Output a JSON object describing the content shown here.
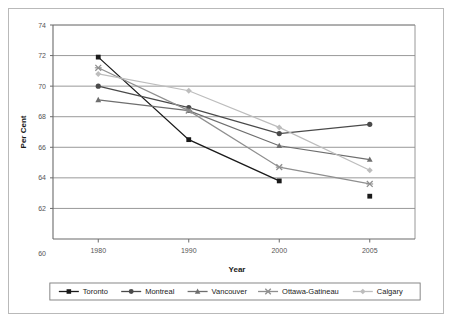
{
  "chart_data": {
    "type": "line",
    "title": "",
    "xlabel": "Year",
    "ylabel": "Per Cent",
    "categories": [
      "1980",
      "1990",
      "2000",
      "2005"
    ],
    "ylim": [
      60,
      74
    ],
    "yticks": [
      60,
      62,
      64,
      66,
      68,
      70,
      72,
      74
    ],
    "ytick_labels": [
      "60",
      "62",
      "64",
      "66",
      "68",
      "70",
      "72",
      "74"
    ],
    "grid": true,
    "legend_position": "bottom",
    "series": [
      {
        "name": "Toronto",
        "values": [
          71.9,
          66.5,
          63.8,
          62.8
        ],
        "color": "#1a1a1a",
        "marker": "square",
        "last_point_detached": true
      },
      {
        "name": "Montreal",
        "values": [
          70.0,
          68.6,
          66.9,
          67.5
        ],
        "color": "#4a4a4a",
        "marker": "circle",
        "last_point_detached": false
      },
      {
        "name": "Vancouver",
        "values": [
          69.1,
          68.4,
          66.1,
          65.2
        ],
        "color": "#6e6e6e",
        "marker": "triangle",
        "last_point_detached": false
      },
      {
        "name": "Ottawa-Gatineau",
        "values": [
          71.2,
          68.4,
          64.7,
          63.6
        ],
        "color": "#8f8f8f",
        "marker": "x",
        "last_point_detached": false
      },
      {
        "name": "Calgary",
        "values": [
          70.8,
          69.7,
          67.3,
          64.5
        ],
        "color": "#bdbdbd",
        "marker": "diamond",
        "last_point_detached": false
      }
    ]
  },
  "axes": {
    "y_title": "Per Cent",
    "x_title": "Year",
    "y_labels": [
      "74",
      "72",
      "70",
      "68",
      "66",
      "64",
      "62",
      "60"
    ],
    "x_labels": [
      "1980",
      "1990",
      "2000",
      "2005"
    ]
  },
  "legend": {
    "items": [
      {
        "label": "Toronto",
        "marker": "square",
        "color": "#1a1a1a"
      },
      {
        "label": "Montreal",
        "marker": "circle",
        "color": "#4a4a4a"
      },
      {
        "label": "Vancouver",
        "marker": "triangle",
        "color": "#6e6e6e"
      },
      {
        "label": "Ottawa-Gatineau",
        "marker": "x",
        "color": "#8f8f8f"
      },
      {
        "label": "Calgary",
        "marker": "diamond",
        "color": "#bdbdbd"
      }
    ]
  }
}
